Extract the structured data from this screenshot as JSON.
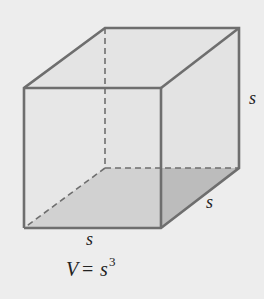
{
  "figure": {
    "type": "cube",
    "labels": {
      "height": "s",
      "depth": "s",
      "width": "s"
    },
    "formula": {
      "lhs": "V",
      "equals": "=",
      "base": "s",
      "exponent": "3"
    },
    "colors": {
      "background": "#ededed",
      "face": "#e4e4e4",
      "base_shade": "#bcbcbc",
      "edge": "#6e6e6e",
      "text": "#222222"
    }
  }
}
